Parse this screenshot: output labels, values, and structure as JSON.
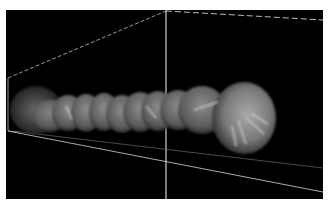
{
  "image": {
    "subject": "3D volume rendering of a segmented tubular structure inside a perspective bounding box",
    "background_color": "#000000",
    "frame_color": "#ffffff",
    "bounding_box_color": "#bdbdbd",
    "object_tone": "grayscale"
  }
}
